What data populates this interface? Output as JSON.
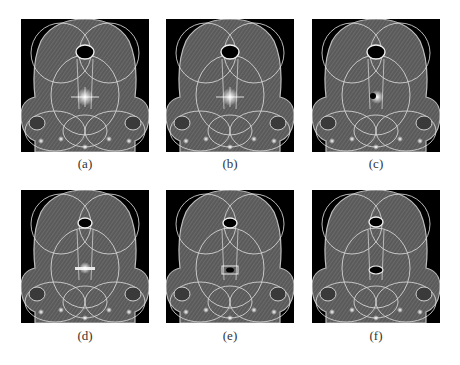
{
  "figure": {
    "panels": [
      {
        "id": "a",
        "caption": "(a)",
        "x": 21,
        "y": 19,
        "center": "star"
      },
      {
        "id": "b",
        "caption": "(b)",
        "x": 166,
        "y": 19,
        "center": "star"
      },
      {
        "id": "c",
        "caption": "(c)",
        "x": 312,
        "y": 19,
        "center": "dot"
      },
      {
        "id": "d",
        "caption": "(d)",
        "x": 21,
        "y": 190,
        "center": "bar"
      },
      {
        "id": "e",
        "caption": "(e)",
        "x": 166,
        "y": 190,
        "center": "smallhole"
      },
      {
        "id": "f",
        "caption": "(f)",
        "x": 312,
        "y": 190,
        "center": "hole"
      }
    ]
  }
}
